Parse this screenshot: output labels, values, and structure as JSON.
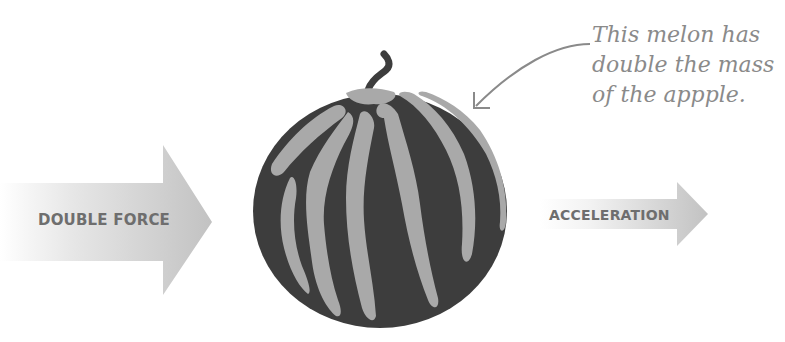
{
  "diagram": {
    "left_arrow": {
      "label": "DOUBLE FORCE",
      "icon": "right-arrow-icon"
    },
    "right_arrow": {
      "label": "ACCELERATION",
      "icon": "right-arrow-icon"
    },
    "object": {
      "name": "watermelon",
      "icon": "watermelon-icon"
    },
    "annotation": {
      "lines": [
        "This melon has",
        "double the mass",
        "of the appple."
      ],
      "pointer_icon": "curved-arrow-icon"
    }
  },
  "colors": {
    "arrow_gradient_start": "#ffffff",
    "arrow_gradient_end": "#c4c4c4",
    "label_text": "#6e6e6e",
    "melon_dark": "#3d3d3d",
    "melon_stripe": "#a9a9a9",
    "annotation_text": "#8a8a8a"
  }
}
